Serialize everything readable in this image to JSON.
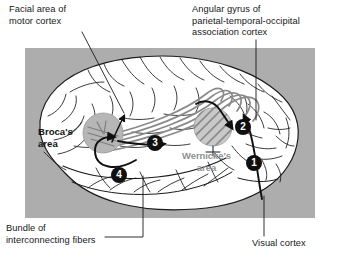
{
  "figure": {
    "panel_background": "#adadad",
    "brain_fill": "#ffffff",
    "outline_color": "#1a1a1a",
    "fiber_color": "#8a8a8a",
    "brocas_fill": "#b6b6b6",
    "wernickes_fill": "#c9c9c9",
    "marker_color": "#101010"
  },
  "callouts": {
    "facial_motor": "Facial area of\nmotor cortex",
    "angular_gyrus": "Angular gyrus of\nparietal-temporal-occipital\nassociation cortex",
    "bundle_fibers": "Bundle of\ninterconnecting fibers",
    "visual_cortex": "Visual cortex"
  },
  "regions": {
    "brocas": "Broca's\narea",
    "wernickes": "Wernicke's\narea"
  },
  "steps": [
    {
      "number": "1",
      "name": "visual-cortex-input"
    },
    {
      "number": "2",
      "name": "wernickes-area-arrival"
    },
    {
      "number": "3",
      "name": "arcuate-fiber-bundle"
    },
    {
      "number": "4",
      "name": "brocas-area-output"
    }
  ]
}
